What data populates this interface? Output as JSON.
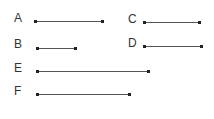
{
  "segments": [
    {
      "label": "A",
      "lx": 14,
      "ly": 12,
      "x1": 35,
      "x2": 103,
      "y": 21
    },
    {
      "label": "B",
      "lx": 14,
      "ly": 38,
      "x1": 37,
      "x2": 76,
      "y": 48
    },
    {
      "label": "C",
      "lx": 128,
      "ly": 13,
      "x1": 144,
      "x2": 200,
      "y": 22
    },
    {
      "label": "D",
      "lx": 128,
      "ly": 37,
      "x1": 144,
      "x2": 202,
      "y": 46
    },
    {
      "label": "E",
      "lx": 14,
      "ly": 62,
      "x1": 37,
      "x2": 149,
      "y": 71
    },
    {
      "label": "F",
      "lx": 14,
      "ly": 85,
      "x1": 37,
      "x2": 130,
      "y": 94
    }
  ]
}
